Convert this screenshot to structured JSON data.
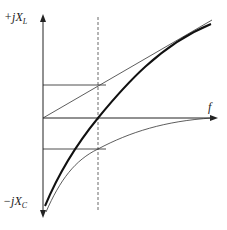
{
  "diagram": {
    "y_axis_top_label": "+jX",
    "y_axis_top_sub": "L",
    "y_axis_bottom_label": "−jX",
    "y_axis_bottom_sub": "C",
    "x_axis_label": "f",
    "curves": [
      {
        "name": "inductive-reactance",
        "shape": "straight line rising from origin"
      },
      {
        "name": "net-reactance",
        "shape": "thick curve crossing zero at resonance"
      },
      {
        "name": "capacitive-reactance",
        "shape": "curve rising from -infinity toward zero"
      }
    ],
    "markers": [
      "dashed vertical line at resonant frequency",
      "horizontal reference lines at +X and -X"
    ],
    "colors": {
      "line": "#222222",
      "background": "#ffffff"
    }
  }
}
